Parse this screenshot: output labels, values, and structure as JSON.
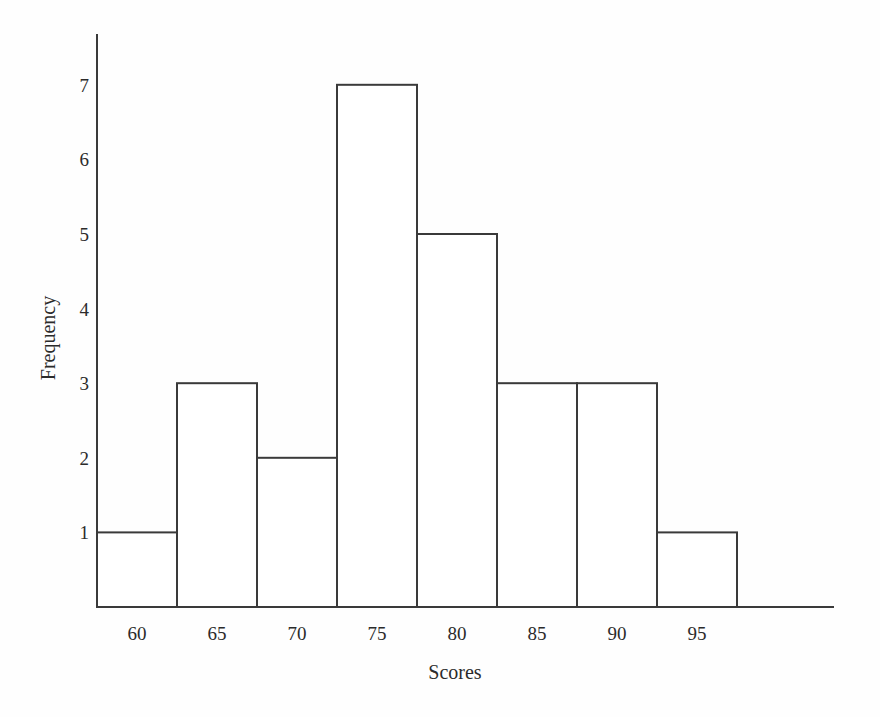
{
  "chart_data": {
    "type": "bar",
    "title": "",
    "subtitle": "",
    "xlabel": "Scores",
    "ylabel": "Frequency",
    "categories": [
      "60",
      "65",
      "70",
      "75",
      "80",
      "85",
      "90",
      "95"
    ],
    "values": [
      1,
      3,
      2,
      7,
      5,
      3,
      3,
      1
    ],
    "xtick_labels": [
      "60",
      "65",
      "70",
      "75",
      "80",
      "85",
      "90",
      "95"
    ],
    "ytick_labels": [
      "1",
      "2",
      "3",
      "4",
      "5",
      "6",
      "7"
    ],
    "ytick_values": [
      1,
      2,
      3,
      4,
      5,
      6,
      7
    ],
    "ylim": [
      0,
      7.6
    ],
    "xlim": [
      57.5,
      97.5
    ],
    "bin_width": 5,
    "bin_edges": [
      57.5,
      62.5,
      67.5,
      72.5,
      77.5,
      82.5,
      87.5,
      92.5,
      97.5
    ],
    "grid": false,
    "legend": null,
    "legend_position": "none",
    "annotations": [],
    "bar_fill_color": "#ffffff",
    "bar_edge_color": "#3a3a3a",
    "axis_color": "#3a3a3a",
    "background_color": "#fefefe",
    "text_color": "#2b2b2b"
  },
  "figure": {
    "caption": ""
  }
}
